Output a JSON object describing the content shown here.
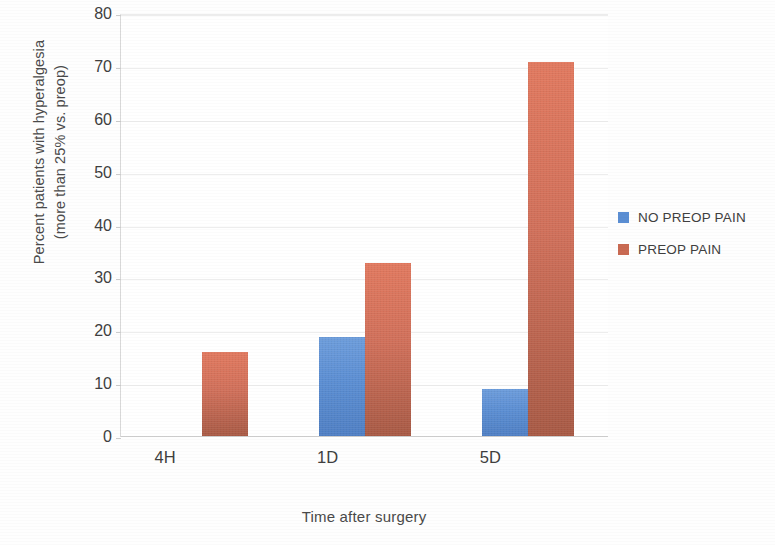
{
  "chart_data": {
    "type": "bar",
    "title": "",
    "xlabel": "Time after surgery",
    "ylabel": "Percent patients with hyperalgesia\n(more than 25% vs. preop)",
    "ylabel_line1": "Percent patients with hyperalgesia",
    "ylabel_line2": "(more than 25% vs. preop)",
    "categories": [
      "4H",
      "1D",
      "5D"
    ],
    "ylim": [
      0,
      80
    ],
    "ytick_values": [
      0,
      10,
      20,
      30,
      40,
      50,
      60,
      70,
      80
    ],
    "ytick_labels": [
      "0",
      "10",
      "20",
      "30",
      "40",
      "50",
      "60",
      "70",
      "80"
    ],
    "grid": true,
    "grid_axis": "y",
    "legend_position": "right",
    "series": [
      {
        "name": "NO PREOP PAIN",
        "color": "#5B8ED3",
        "values": [
          0,
          19,
          9
        ]
      },
      {
        "name": "PREOP PAIN",
        "color": "#C96A52",
        "values": [
          16,
          33,
          71
        ]
      }
    ]
  },
  "colors": {
    "blue": "#5B8ED3",
    "red": "#C96A52",
    "axis": "#d9d9d9",
    "grid": "#ededed",
    "text": "#3f3f3f",
    "background": "#ffffff"
  }
}
